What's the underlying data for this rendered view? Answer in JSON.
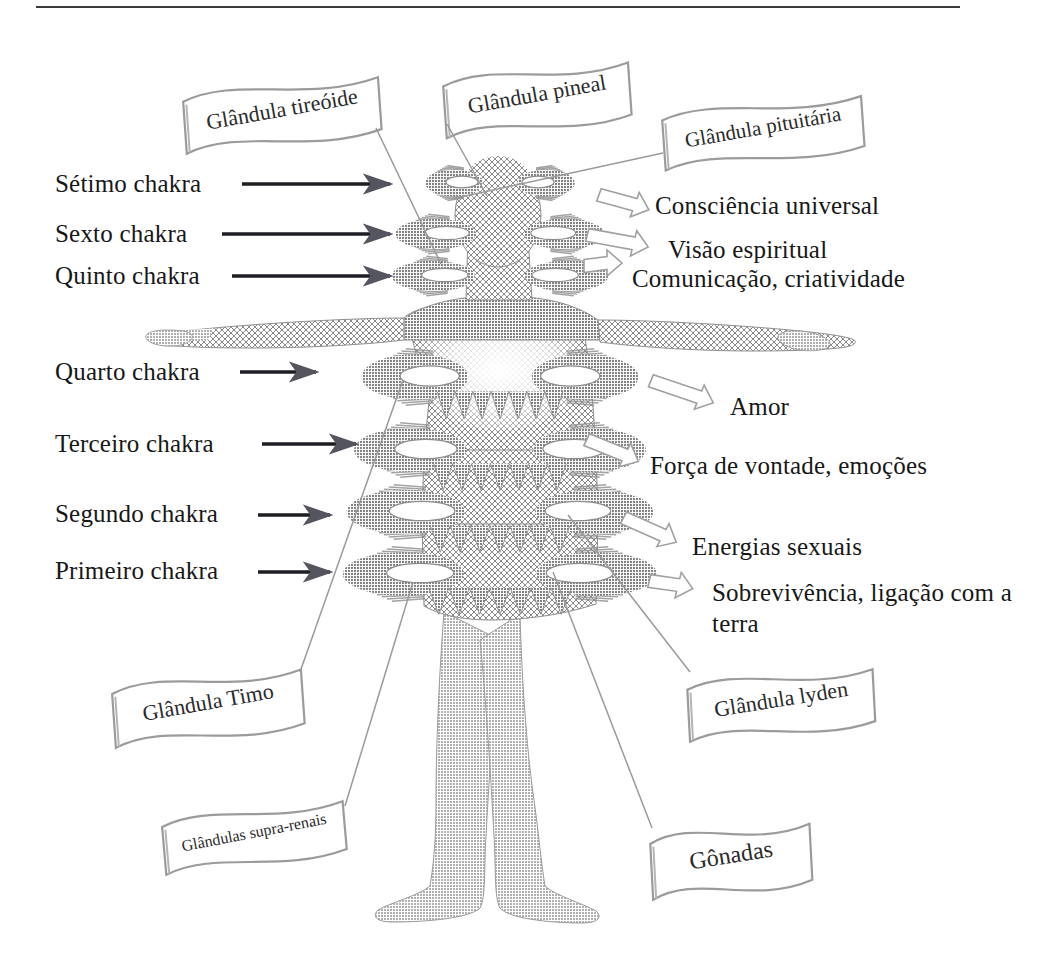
{
  "figure": {
    "rule_color": "#3a3a3a",
    "ink_color": "#171717",
    "body_tone": "#9a9a9a",
    "aura_tone": "#8d8d8d"
  },
  "chakra_labels": [
    {
      "id": "setimo",
      "label": "Sétimo chakra",
      "x": 55,
      "y": 170,
      "arrow_x1": 242,
      "arrow_x2": 396,
      "arrow_y": 184
    },
    {
      "id": "sexto",
      "label": "Sexto chakra",
      "x": 55,
      "y": 220,
      "arrow_x1": 222,
      "arrow_x2": 396,
      "arrow_y": 234
    },
    {
      "id": "quinto",
      "label": "Quinto chakra",
      "x": 55,
      "y": 262,
      "arrow_x1": 232,
      "arrow_x2": 396,
      "arrow_y": 276
    },
    {
      "id": "quarto",
      "label": "Quarto chakra",
      "x": 55,
      "y": 358,
      "arrow_x1": 240,
      "arrow_x2": 322,
      "arrow_y": 372
    },
    {
      "id": "terceiro",
      "label": "Terceiro chakra",
      "x": 55,
      "y": 430,
      "arrow_x1": 262,
      "arrow_x2": 362,
      "arrow_y": 444
    },
    {
      "id": "segundo",
      "label": "Segundo chakra",
      "x": 55,
      "y": 500,
      "arrow_x1": 258,
      "arrow_x2": 336,
      "arrow_y": 515
    },
    {
      "id": "primeiro",
      "label": "Primeiro chakra",
      "x": 55,
      "y": 557,
      "arrow_x1": 258,
      "arrow_x2": 336,
      "arrow_y": 572
    }
  ],
  "function_labels": [
    {
      "id": "consciencia",
      "label": "Consciência universal",
      "x": 655,
      "y": 192,
      "two_line": false,
      "arrow": {
        "x": 600,
        "y": 192,
        "w": 52,
        "angle": 20
      }
    },
    {
      "id": "visao",
      "label": "Visão espiritual",
      "x": 668,
      "y": 236,
      "two_line": false,
      "arrow": {
        "x": 588,
        "y": 232,
        "w": 62,
        "angle": 14
      }
    },
    {
      "id": "comunicacao",
      "label": "Comunicação, criatividade",
      "x": 632,
      "y": 265,
      "two_line": false,
      "arrow": {
        "x": 584,
        "y": 263,
        "w": 38,
        "angle": 0
      }
    },
    {
      "id": "amor",
      "label": "Amor",
      "x": 730,
      "y": 393,
      "two_line": false,
      "arrow": {
        "x": 652,
        "y": 378,
        "w": 66,
        "angle": 22
      }
    },
    {
      "id": "forca",
      "label": "Força de vontade, emoções",
      "x": 650,
      "y": 452,
      "two_line": false,
      "arrow": {
        "x": 588,
        "y": 437,
        "w": 56,
        "angle": 26
      }
    },
    {
      "id": "energias",
      "label": "Energias sexuais",
      "x": 692,
      "y": 533,
      "two_line": false,
      "arrow": {
        "x": 625,
        "y": 515,
        "w": 58,
        "angle": 28
      }
    },
    {
      "id": "sobrevivencia",
      "label": "Sobrevivência, ligação com a terra",
      "x": 712,
      "y": 578,
      "two_line": true,
      "arrow": {
        "x": 650,
        "y": 578,
        "w": 44,
        "angle": 14
      }
    }
  ],
  "gland_banners": [
    {
      "id": "tireoide",
      "label": "Glândula tireóide",
      "cx": 282,
      "cy": 110,
      "w": 196,
      "h": 52,
      "font": 22,
      "rot": -4,
      "pole_x": 376,
      "pole_y": 128,
      "tip_x": 441,
      "tip_y": 264
    },
    {
      "id": "pineal",
      "label": "Glândula pineal",
      "cx": 537,
      "cy": 95,
      "w": 186,
      "h": 52,
      "font": 22,
      "rot": -4,
      "pole_x": 447,
      "pole_y": 124,
      "tip_x": 487,
      "tip_y": 196
    },
    {
      "id": "pituitaria",
      "label": "Glândula pituitária",
      "cx": 763,
      "cy": 128,
      "w": 200,
      "h": 50,
      "font": 21,
      "rot": -4,
      "pole_x": 663,
      "pole_y": 153,
      "tip_x": 452,
      "tip_y": 199
    },
    {
      "id": "timo",
      "label": "Glândula Timo",
      "cx": 208,
      "cy": 703,
      "w": 190,
      "h": 54,
      "font": 22,
      "rot": -4,
      "pole_x": 300,
      "pole_y": 672,
      "tip_x": 403,
      "tip_y": 380
    },
    {
      "id": "lyden",
      "label": "Glândula lyden",
      "cx": 781,
      "cy": 700,
      "w": 186,
      "h": 52,
      "font": 22,
      "rot": -3,
      "pole_x": 690,
      "pole_y": 672,
      "tip_x": 568,
      "tip_y": 515
    },
    {
      "id": "supra-renais",
      "label": "Glândulas supra-renais",
      "cx": 254,
      "cy": 833,
      "w": 182,
      "h": 48,
      "font": 16,
      "rot": -5,
      "pole_x": 345,
      "pole_y": 806,
      "tip_x": 413,
      "tip_y": 582
    },
    {
      "id": "gonadas",
      "label": "Gônadas",
      "cx": 731,
      "cy": 856,
      "w": 160,
      "h": 56,
      "font": 24,
      "rot": -3,
      "pole_x": 652,
      "pole_y": 828,
      "tip_x": 553,
      "tip_y": 572
    }
  ],
  "chakra_bands": [
    {
      "id": "band7",
      "cy": 183,
      "rx": 73,
      "ry": 14,
      "core_rx": 40,
      "core_ry": 9
    },
    {
      "id": "band6",
      "cy": 234,
      "rx": 98,
      "ry": 16,
      "core_rx": 56,
      "core_ry": 11
    },
    {
      "id": "band5",
      "cy": 276,
      "rx": 100,
      "ry": 16,
      "core_rx": 58,
      "core_ry": 11
    },
    {
      "id": "band4",
      "cy": 377,
      "rx": 128,
      "ry": 24,
      "core_rx": 74,
      "core_ry": 15
    },
    {
      "id": "band3",
      "cy": 450,
      "rx": 136,
      "ry": 23,
      "core_rx": 78,
      "core_ry": 14
    },
    {
      "id": "band2",
      "cy": 512,
      "rx": 146,
      "ry": 23,
      "core_rx": 82,
      "core_ry": 14
    },
    {
      "id": "band1",
      "cy": 574,
      "rx": 148,
      "ry": 23,
      "core_rx": 84,
      "core_ry": 14
    }
  ],
  "top_rule": {
    "x1": 36,
    "x2": 960,
    "y": 7
  }
}
